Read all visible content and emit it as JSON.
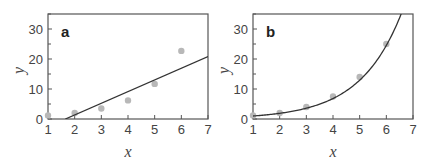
{
  "colors": {
    "frame": "#555555",
    "fit_line": "#333333",
    "points": "#b8b8b8",
    "text": "#444444"
  },
  "chart_data": [
    {
      "type": "scatter",
      "panel_label": "a",
      "title": "",
      "xlabel": "x",
      "ylabel": "y",
      "xlim": [
        1,
        7
      ],
      "ylim": [
        0,
        35
      ],
      "xticks": [
        1,
        2,
        3,
        4,
        5,
        6,
        7
      ],
      "yticks": [
        0,
        10,
        20,
        30
      ],
      "grid": false,
      "legend": null,
      "series": [
        {
          "name": "data",
          "x": [
            1,
            2,
            3,
            4,
            5,
            6
          ],
          "y": [
            1.2,
            2,
            3.5,
            6.2,
            11.7,
            22.7
          ]
        },
        {
          "name": "linear fit",
          "kind": "line",
          "x": [
            1.65,
            7
          ],
          "y": [
            0,
            20.8
          ]
        }
      ]
    },
    {
      "type": "scatter",
      "panel_label": "b",
      "title": "",
      "xlabel": "x",
      "ylabel": "y",
      "xlim": [
        1,
        7
      ],
      "ylim": [
        0,
        35
      ],
      "xticks": [
        1,
        2,
        3,
        4,
        5,
        6,
        7
      ],
      "yticks": [
        0,
        10,
        20,
        30
      ],
      "grid": false,
      "legend": null,
      "series": [
        {
          "name": "data",
          "x": [
            1,
            2,
            3,
            4,
            5,
            6
          ],
          "y": [
            1.2,
            2,
            4,
            7.5,
            14,
            25
          ]
        },
        {
          "name": "exponential fit",
          "kind": "curve",
          "x": [
            1,
            2,
            3,
            4,
            5,
            6,
            6.6
          ],
          "y": [
            1.0,
            2.0,
            3.8,
            7.3,
            13.8,
            25.8,
            35
          ]
        }
      ]
    }
  ]
}
